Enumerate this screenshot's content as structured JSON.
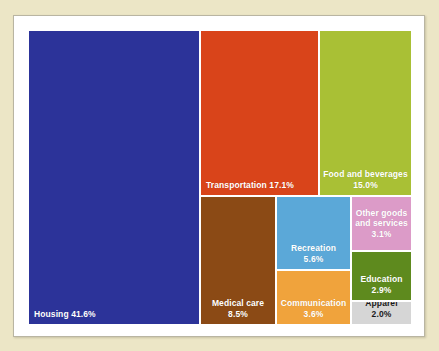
{
  "chart_data": {
    "type": "treemap",
    "title": "",
    "subtitle": "",
    "xlabel": "",
    "ylabel": "",
    "legend": "none",
    "grid": false,
    "units": "percent of total expenditures",
    "categories": [
      "Housing",
      "Transportation",
      "Food and beverages",
      "Medical care",
      "Recreation",
      "Communication",
      "Other goods and services",
      "Education",
      "Apparel"
    ],
    "values": [
      41.6,
      17.1,
      15.0,
      8.5,
      5.6,
      3.6,
      3.1,
      2.9,
      2.0
    ],
    "total": 99.4,
    "tiles": [
      {
        "name": "housing",
        "label": "Housing",
        "value": 41.6,
        "value_text": "41.6%",
        "display": "Housing 41.6%",
        "lines": [
          "Housing 41.6%"
        ],
        "color": "#2C3399",
        "text_color": "#FFFFFF",
        "label_align": "left",
        "label_position": "bottom",
        "rect": {
          "x": 0,
          "y": 0,
          "w": 170,
          "h": 293
        }
      },
      {
        "name": "transportation",
        "label": "Transportation",
        "value": 17.1,
        "value_text": "17.1%",
        "display": "Transportation 17.1%",
        "lines": [
          "Transportation 17.1%"
        ],
        "color": "#D9441A",
        "text_color": "#FFFFFF",
        "label_align": "left",
        "label_position": "bottom",
        "rect": {
          "x": 172,
          "y": 0,
          "w": 117,
          "h": 164
        }
      },
      {
        "name": "food-and-beverages",
        "label": "Food and beverages",
        "value": 15.0,
        "value_text": "15.0%",
        "display": "Food and beverages 15.0%",
        "lines": [
          "Food and beverages",
          "15.0%"
        ],
        "color": "#A9C035",
        "text_color": "#FFFFFF",
        "label_align": "center",
        "label_position": "bottom",
        "rect": {
          "x": 291,
          "y": 0,
          "w": 91,
          "h": 164
        }
      },
      {
        "name": "medical-care",
        "label": "Medical care",
        "value": 8.5,
        "value_text": "8.5%",
        "display": "Medical care 8.5%",
        "lines": [
          "Medical care",
          "8.5%"
        ],
        "color": "#8B4A15",
        "text_color": "#FFFFFF",
        "label_align": "center",
        "label_position": "bottom",
        "rect": {
          "x": 172,
          "y": 166,
          "w": 74,
          "h": 127
        }
      },
      {
        "name": "recreation",
        "label": "Recreation",
        "value": 5.6,
        "value_text": "5.6%",
        "display": "Recreation 5.6%",
        "lines": [
          "Recreation",
          "5.6%"
        ],
        "color": "#5BA8D8",
        "text_color": "#FFFFFF",
        "label_align": "center",
        "label_position": "bottom",
        "rect": {
          "x": 248,
          "y": 166,
          "w": 73,
          "h": 72
        }
      },
      {
        "name": "communication",
        "label": "Communication",
        "value": 3.6,
        "value_text": "3.6%",
        "display": "Communication 3.6%",
        "lines": [
          "Communication",
          "3.6%"
        ],
        "color": "#F0A33C",
        "text_color": "#FFFFFF",
        "label_align": "center",
        "label_position": "bottom",
        "rect": {
          "x": 248,
          "y": 240,
          "w": 73,
          "h": 53
        }
      },
      {
        "name": "other-goods-and-services",
        "label": "Other goods and services",
        "value": 3.1,
        "value_text": "3.1%",
        "display": "Other goods and services 3.1%",
        "lines": [
          "Other goods",
          "and services",
          "3.1%"
        ],
        "color": "#DC9BC8",
        "text_color": "#FFFFFF",
        "label_align": "center",
        "label_position": "middle",
        "rect": {
          "x": 323,
          "y": 166,
          "w": 59,
          "h": 53
        }
      },
      {
        "name": "education",
        "label": "Education",
        "value": 2.9,
        "value_text": "2.9%",
        "display": "Education 2.9%",
        "lines": [
          "Education",
          "2.9%"
        ],
        "color": "#5E8A1E",
        "text_color": "#FFFFFF",
        "label_align": "center",
        "label_position": "bottom",
        "rect": {
          "x": 323,
          "y": 221,
          "w": 59,
          "h": 48
        }
      },
      {
        "name": "apparel",
        "label": "Apparel",
        "value": 2.0,
        "value_text": "2.0%",
        "display": "Apparel 2.0%",
        "lines": [
          "Apparel",
          "2.0%"
        ],
        "color": "#D6D6D6",
        "text_color": "#1A1A1A",
        "label_align": "center",
        "label_position": "bottom",
        "rect": {
          "x": 323,
          "y": 271,
          "w": 59,
          "h": 22
        }
      }
    ]
  },
  "page": {
    "background_color": "#ECE6C6",
    "frame_color": "#FFFFFF"
  }
}
